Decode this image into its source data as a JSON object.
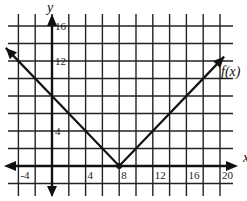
{
  "chart_data": {
    "type": "line",
    "title": "",
    "xlabel": "x",
    "ylabel": "y",
    "function_label": "f(x)",
    "equation": "f(x) = |x - 8|",
    "xlim": [
      -6,
      22
    ],
    "ylim": [
      -2,
      18
    ],
    "grid": true,
    "grid_step": 2,
    "x_ticks": [
      -4,
      4,
      8,
      12,
      16,
      20
    ],
    "y_ticks": [
      4,
      12,
      16
    ],
    "x_tick_labels": [
      "-4",
      "4",
      "8",
      "12",
      "16",
      "20"
    ],
    "y_tick_labels": [
      "4",
      "12",
      "16"
    ],
    "series": [
      {
        "name": "f(x)",
        "points": [
          [
            -5.5,
            13.5
          ],
          [
            0,
            8
          ],
          [
            8,
            0
          ],
          [
            20.5,
            12.5
          ]
        ],
        "vertex": [
          8,
          0
        ],
        "arrows_at_ends": true
      }
    ],
    "colors": {
      "line": "#111111",
      "grid": "#222222",
      "background": "#ffffff"
    }
  }
}
